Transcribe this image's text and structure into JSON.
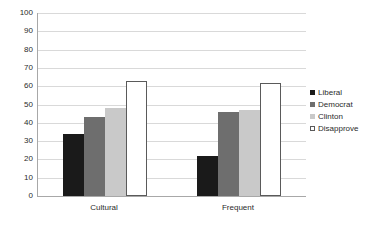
{
  "chart_data": {
    "type": "bar",
    "title": "",
    "subtitle": "",
    "xlabel": "",
    "ylabel": "",
    "categories": [
      "Cultural",
      "Frequent"
    ],
    "series": [
      {
        "name": "Liberal",
        "values": [
          34,
          22
        ],
        "color": "#1a1a1a"
      },
      {
        "name": "Democrat",
        "values": [
          43,
          46
        ],
        "color": "#6e6e6e"
      },
      {
        "name": "Clinton",
        "values": [
          48,
          47
        ],
        "color": "#c9c9c9"
      },
      {
        "name": "Disapprove",
        "values": [
          63,
          62
        ],
        "color": "#ffffff"
      }
    ],
    "ylim": [
      0,
      100
    ],
    "ytick_step": 10,
    "yticks": [
      100,
      90,
      80,
      70,
      60,
      50,
      40,
      30,
      20,
      10,
      0
    ],
    "ytick_labels": [
      "100",
      "90",
      "80",
      "70",
      "60",
      "50",
      "40",
      "30",
      "20",
      "10",
      "0"
    ],
    "grid": true,
    "grid_axis": "y",
    "grid_color": "#d9d9d9",
    "axis_color": "#a8a8a8",
    "legend": true,
    "legend_position": "right",
    "background": "#ffffff",
    "text_color": "#2b2b2b"
  }
}
